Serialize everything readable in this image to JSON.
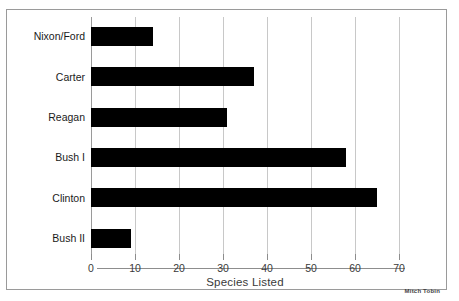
{
  "chart_data": {
    "type": "bar",
    "orientation": "horizontal",
    "title": "",
    "categories": [
      "Nixon/Ford",
      "Carter",
      "Reagan",
      "Bush I",
      "Clinton",
      "Bush II"
    ],
    "values": [
      14,
      37,
      31,
      58,
      65,
      9
    ],
    "xlabel": "Species Listed",
    "ylabel": "",
    "xlim": [
      0,
      70
    ],
    "xticks": [
      0,
      10,
      20,
      30,
      40,
      50,
      60,
      70
    ],
    "xtick_labels": [
      "0",
      "10",
      "20",
      "30",
      "40",
      "50",
      "60",
      "70"
    ],
    "grid": "vertical",
    "legend": "none",
    "bar_color": "#000000",
    "gridline_color": "#c8c8c8",
    "annotations": [
      "Mitch Tobin"
    ]
  },
  "attribution": "Mitch Tobin"
}
